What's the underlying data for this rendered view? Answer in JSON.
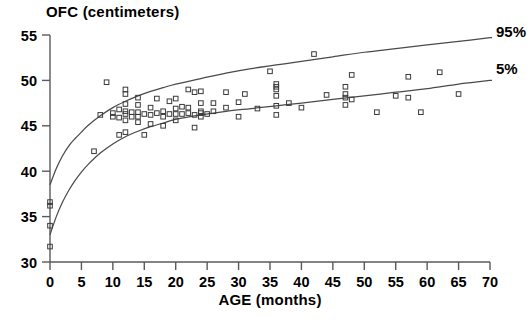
{
  "chart_data": {
    "type": "scatter",
    "title": "OFC  (centimeters)",
    "xlabel": "AGE (months)",
    "ylabel": "OFC (centimeters)",
    "xlim": [
      0,
      70
    ],
    "ylim": [
      30,
      55
    ],
    "xticks": [
      0,
      5,
      10,
      15,
      20,
      25,
      30,
      35,
      40,
      45,
      50,
      55,
      60,
      65,
      70
    ],
    "yticks": [
      30,
      35,
      40,
      45,
      50,
      55
    ],
    "grid": false,
    "legend_position": "right-inline",
    "series": [
      {
        "name": "95%",
        "type": "line",
        "label": "95%",
        "points": [
          [
            0,
            38.5
          ],
          [
            1,
            40.3
          ],
          [
            2,
            41.7
          ],
          [
            3,
            42.8
          ],
          [
            4,
            43.6
          ],
          [
            5,
            44.3
          ],
          [
            6,
            45.0
          ],
          [
            8,
            46.1
          ],
          [
            10,
            47.0
          ],
          [
            12,
            47.7
          ],
          [
            14,
            48.3
          ],
          [
            16,
            48.8
          ],
          [
            18,
            49.2
          ],
          [
            20,
            49.6
          ],
          [
            24,
            50.2
          ],
          [
            28,
            50.8
          ],
          [
            32,
            51.3
          ],
          [
            36,
            51.7
          ],
          [
            40,
            52.1
          ],
          [
            45,
            52.6
          ],
          [
            50,
            53.1
          ],
          [
            55,
            53.5
          ],
          [
            60,
            53.9
          ],
          [
            65,
            54.3
          ],
          [
            70,
            54.7
          ]
        ]
      },
      {
        "name": "5%",
        "type": "line",
        "label": "5%",
        "points": [
          [
            0,
            33.0
          ],
          [
            1,
            35.0
          ],
          [
            2,
            36.6
          ],
          [
            3,
            37.9
          ],
          [
            4,
            39.0
          ],
          [
            5,
            39.9
          ],
          [
            6,
            40.7
          ],
          [
            8,
            42.0
          ],
          [
            10,
            43.0
          ],
          [
            12,
            43.8
          ],
          [
            14,
            44.4
          ],
          [
            16,
            44.9
          ],
          [
            18,
            45.3
          ],
          [
            20,
            45.7
          ],
          [
            24,
            46.2
          ],
          [
            28,
            46.6
          ],
          [
            32,
            46.9
          ],
          [
            36,
            47.2
          ],
          [
            40,
            47.5
          ],
          [
            45,
            47.9
          ],
          [
            50,
            48.3
          ],
          [
            55,
            48.7
          ],
          [
            60,
            49.1
          ],
          [
            65,
            49.6
          ],
          [
            70,
            50.0
          ]
        ]
      },
      {
        "name": "patients",
        "type": "scatter",
        "marker": "open-square",
        "points": [
          [
            0,
            36.6
          ],
          [
            0,
            36.2
          ],
          [
            0,
            34.0
          ],
          [
            0,
            31.7
          ],
          [
            7,
            42.2
          ],
          [
            8,
            46.2
          ],
          [
            9,
            49.8
          ],
          [
            10,
            46.0
          ],
          [
            10,
            46.4
          ],
          [
            11,
            46.8
          ],
          [
            11,
            45.9
          ],
          [
            11,
            44.0
          ],
          [
            12,
            49.0
          ],
          [
            12,
            48.5
          ],
          [
            12,
            47.4
          ],
          [
            12,
            46.6
          ],
          [
            12,
            46.3
          ],
          [
            12,
            45.6
          ],
          [
            12,
            44.3
          ],
          [
            13,
            46.5
          ],
          [
            13,
            46.0
          ],
          [
            14,
            48.1
          ],
          [
            14,
            47.3
          ],
          [
            14,
            46.5
          ],
          [
            14,
            46.0
          ],
          [
            14,
            45.4
          ],
          [
            15,
            46.3
          ],
          [
            15,
            44.0
          ],
          [
            16,
            47.0
          ],
          [
            16,
            46.2
          ],
          [
            16,
            45.2
          ],
          [
            17,
            48.0
          ],
          [
            17,
            46.4
          ],
          [
            18,
            46.6
          ],
          [
            18,
            46.0
          ],
          [
            18,
            45.0
          ],
          [
            19,
            47.7
          ],
          [
            19,
            46.3
          ],
          [
            20,
            48.0
          ],
          [
            20,
            46.9
          ],
          [
            20,
            46.3
          ],
          [
            20,
            45.6
          ],
          [
            21,
            47.1
          ],
          [
            21,
            46.3
          ],
          [
            22,
            49.0
          ],
          [
            22,
            47.0
          ],
          [
            22,
            46.4
          ],
          [
            23,
            48.7
          ],
          [
            23,
            46.2
          ],
          [
            23,
            44.8
          ],
          [
            24,
            48.8
          ],
          [
            24,
            47.5
          ],
          [
            24,
            46.6
          ],
          [
            24,
            46.4
          ],
          [
            24,
            46.0
          ],
          [
            25,
            46.3
          ],
          [
            26,
            47.5
          ],
          [
            26,
            46.6
          ],
          [
            28,
            48.7
          ],
          [
            28,
            47.0
          ],
          [
            30,
            47.6
          ],
          [
            30,
            46.0
          ],
          [
            31,
            48.5
          ],
          [
            33,
            46.9
          ],
          [
            35,
            51.0
          ],
          [
            36,
            49.6
          ],
          [
            36,
            49.3
          ],
          [
            36,
            49.0
          ],
          [
            36,
            48.3
          ],
          [
            36,
            47.2
          ],
          [
            36,
            46.2
          ],
          [
            38,
            47.5
          ],
          [
            40,
            47.0
          ],
          [
            42,
            52.9
          ],
          [
            44,
            48.4
          ],
          [
            47,
            49.3
          ],
          [
            47,
            48.5
          ],
          [
            47,
            48.1
          ],
          [
            47,
            47.3
          ],
          [
            48,
            50.6
          ],
          [
            48,
            47.9
          ],
          [
            52,
            46.5
          ],
          [
            55,
            48.3
          ],
          [
            57,
            50.4
          ],
          [
            57,
            48.1
          ],
          [
            59,
            46.5
          ],
          [
            62,
            50.9
          ],
          [
            65,
            48.5
          ]
        ]
      }
    ]
  },
  "labels": {
    "curve_upper": "95%",
    "curve_lower": "5%"
  }
}
